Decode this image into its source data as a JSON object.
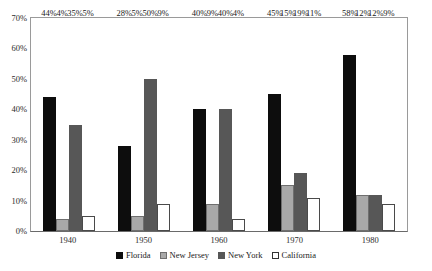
{
  "chart_data": {
    "type": "bar",
    "title": "",
    "xlabel": "",
    "ylabel": "",
    "ylim": [
      0,
      70
    ],
    "ytick_labels": [
      "0%",
      "10%",
      "20%",
      "30%",
      "40%",
      "50%",
      "60%",
      "70%"
    ],
    "ytick_values": [
      0,
      10,
      20,
      30,
      40,
      50,
      60,
      70
    ],
    "grid": false,
    "legend_position": "bottom",
    "categories": [
      "1940",
      "1950",
      "1960",
      "1970",
      "1980"
    ],
    "series": [
      {
        "name": "Florida",
        "color": "#0d0d0d",
        "values": [
          44,
          28,
          40,
          45,
          58
        ],
        "labels": [
          "44%",
          "28%",
          "40%",
          "45%",
          "58%"
        ]
      },
      {
        "name": "New Jersey",
        "color": "#a9a9a9",
        "values": [
          4,
          5,
          9,
          15,
          12
        ],
        "labels": [
          "4%",
          "5%",
          "9%",
          "15%",
          "12%"
        ]
      },
      {
        "name": "New York",
        "color": "#575757",
        "values": [
          35,
          50,
          40,
          19,
          12
        ],
        "labels": [
          "35%",
          "50%",
          "40%",
          "19%",
          "12%"
        ]
      },
      {
        "name": "California",
        "color": "#ffffff",
        "values": [
          5,
          9,
          4,
          11,
          9
        ],
        "labels": [
          "5%",
          "9%",
          "4%",
          "11%",
          "9%"
        ]
      }
    ]
  },
  "legend": {
    "items": [
      {
        "label": "Florida"
      },
      {
        "label": "New Jersey"
      },
      {
        "label": "New York"
      },
      {
        "label": "California"
      }
    ]
  }
}
